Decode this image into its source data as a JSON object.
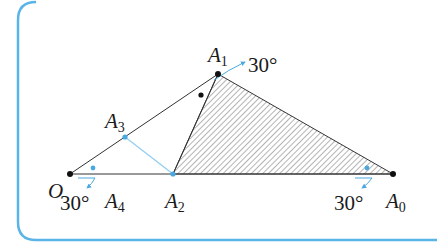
{
  "colors": {
    "frame_border": "#5ab4e8",
    "line": "#333333",
    "accent_blue": "#4aa8e0",
    "point_black": "#111111",
    "hatch": "#555555"
  },
  "diagram": {
    "points": {
      "O": {
        "label": "O",
        "sub": "",
        "x": 70,
        "y": 174
      },
      "A0": {
        "label": "A",
        "sub": "0",
        "x": 393,
        "y": 174
      },
      "A1": {
        "label": "A",
        "sub": "1",
        "x": 218,
        "y": 74
      },
      "A2": {
        "label": "A",
        "sub": "2",
        "x": 173,
        "y": 174
      },
      "A3": {
        "label": "A",
        "sub": "3",
        "x": 125,
        "y": 137
      },
      "A4": {
        "label": "A",
        "sub": "4",
        "x": 118,
        "y": 174
      }
    },
    "angle_labels": {
      "at_A1": "30°",
      "at_O": "30°",
      "at_A0": "30°"
    },
    "shaded_triangle": [
      "A1",
      "A2",
      "A0"
    ]
  }
}
